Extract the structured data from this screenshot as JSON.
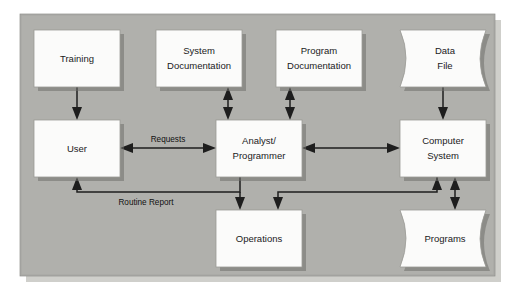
{
  "diagram": {
    "panel": {
      "background_color": "#b0b0ac",
      "shadow_color": "#cfcfcb"
    },
    "node_style": {
      "fill": "#fbfbfa",
      "border": "#9b9b96",
      "shadow": "#6f6f6c"
    },
    "nodes": [
      {
        "id": "training",
        "label": "Training",
        "lines": [
          "Training"
        ],
        "shape": "rect",
        "x": 34,
        "y": 30,
        "w": 86,
        "h": 57
      },
      {
        "id": "system-doc",
        "label": "System Documentation",
        "lines": [
          "System",
          "Documentation"
        ],
        "shape": "rect",
        "x": 156,
        "y": 30,
        "w": 86,
        "h": 57
      },
      {
        "id": "program-doc",
        "label": "Program Documentation",
        "lines": [
          "Program",
          "Documentation"
        ],
        "shape": "rect",
        "x": 276,
        "y": 30,
        "w": 86,
        "h": 57
      },
      {
        "id": "data-file",
        "label": "Data File",
        "lines": [
          "Data",
          "File"
        ],
        "shape": "curved",
        "x": 400,
        "y": 30,
        "w": 86,
        "h": 57
      },
      {
        "id": "user",
        "label": "User",
        "lines": [
          "User"
        ],
        "shape": "rect",
        "x": 34,
        "y": 120,
        "w": 86,
        "h": 57
      },
      {
        "id": "analyst",
        "label": "Analyst/Programmer",
        "lines": [
          "Analyst/",
          "Programmer"
        ],
        "shape": "rect",
        "x": 216,
        "y": 120,
        "w": 86,
        "h": 57
      },
      {
        "id": "computer",
        "label": "Computer System",
        "lines": [
          "Computer",
          "System"
        ],
        "shape": "rect",
        "x": 400,
        "y": 120,
        "w": 86,
        "h": 57
      },
      {
        "id": "operations",
        "label": "Operations",
        "lines": [
          "Operations"
        ],
        "shape": "rect",
        "x": 216,
        "y": 210,
        "w": 86,
        "h": 57
      },
      {
        "id": "programs",
        "label": "Programs",
        "lines": [
          "Programs"
        ],
        "shape": "curved",
        "x": 400,
        "y": 210,
        "w": 86,
        "h": 57
      }
    ],
    "edges": [
      {
        "id": "training-to-user",
        "from": "training",
        "to": "user",
        "label": "",
        "direction": "down"
      },
      {
        "id": "systemdoc-to-analyst",
        "from": "system-doc",
        "to": "analyst",
        "label": "",
        "direction": "both-vertical"
      },
      {
        "id": "programdoc-to-analyst",
        "from": "program-doc",
        "to": "analyst",
        "label": "",
        "direction": "both-vertical"
      },
      {
        "id": "datafile-to-computer",
        "from": "data-file",
        "to": "computer",
        "label": "",
        "direction": "down"
      },
      {
        "id": "user-to-analyst",
        "from": "user",
        "to": "analyst",
        "label": "Requests",
        "direction": "both-horizontal"
      },
      {
        "id": "analyst-to-computer",
        "from": "analyst",
        "to": "computer",
        "label": "",
        "direction": "both-horizontal"
      },
      {
        "id": "analyst-to-user-report",
        "from": "analyst",
        "to": "user",
        "label": "Routine Report",
        "direction": "up-left-elbow"
      },
      {
        "id": "analyst-to-operations",
        "from": "analyst",
        "to": "operations",
        "label": "",
        "direction": "down"
      },
      {
        "id": "computer-to-operations",
        "from": "computer",
        "to": "operations",
        "label": "",
        "direction": "down-left-elbow"
      },
      {
        "id": "computer-to-programs",
        "from": "computer",
        "to": "programs",
        "label": "",
        "direction": "both-vertical"
      }
    ],
    "edge_labels": {
      "requests": "Requests",
      "routine_report": "Routine Report"
    }
  }
}
